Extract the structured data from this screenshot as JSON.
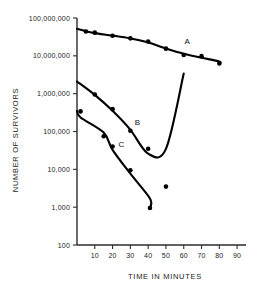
{
  "chart_data": {
    "type": "line",
    "title": "",
    "xlabel": "TIME IN MINUTES",
    "ylabel": "NUMBER OF SURVIVORS",
    "yscale": "log",
    "xlim": [
      0,
      95
    ],
    "ylim": [
      100,
      100000000
    ],
    "grid": false,
    "legend": "inline-curve-labels",
    "x_ticks": [
      10,
      20,
      30,
      40,
      50,
      60,
      70,
      80,
      90
    ],
    "x_tick_labels": [
      "10",
      "20",
      "30",
      "40",
      "50",
      "60",
      "70",
      "80",
      "90"
    ],
    "y_ticks": [
      100,
      1000,
      10000,
      100000,
      1000000,
      10000000,
      100000000
    ],
    "y_tick_labels": [
      "100",
      "1,000",
      "10,000",
      "100,000",
      "1,000,000",
      "10,000,000",
      "100,000,000"
    ],
    "series": [
      {
        "name": "A",
        "label": "A",
        "label_x": 62,
        "label_y": 21000000,
        "fit_line": [
          {
            "x": 0,
            "y": 52000000
          },
          {
            "x": 80,
            "y": 6300000
          }
        ],
        "points": [
          {
            "x": 5,
            "y": 44000000
          },
          {
            "x": 10,
            "y": 41000000
          },
          {
            "x": 20,
            "y": 34000000
          },
          {
            "x": 30,
            "y": 29000000
          },
          {
            "x": 40,
            "y": 24000000
          },
          {
            "x": 50,
            "y": 15500000
          },
          {
            "x": 60,
            "y": 10500000
          },
          {
            "x": 70,
            "y": 9800000
          },
          {
            "x": 80,
            "y": 6300000
          }
        ]
      },
      {
        "name": "B",
        "label": "B",
        "label_x": 34,
        "label_y": 150000,
        "fit_line": [
          {
            "x": 0,
            "y": 2100000
          },
          {
            "x": 60,
            "y": 3400000
          }
        ],
        "points": [
          {
            "x": 10,
            "y": 950000
          },
          {
            "x": 20,
            "y": 390000
          },
          {
            "x": 30,
            "y": 105000
          },
          {
            "x": 40,
            "y": 35000
          },
          {
            "x": 50,
            "y": 3500
          }
        ]
      },
      {
        "name": "C",
        "label": "C",
        "label_x": 25,
        "label_y": 38000,
        "fit_line": [
          {
            "x": 0,
            "y": 350000
          },
          {
            "x": 41,
            "y": 950
          }
        ],
        "points": [
          {
            "x": 2,
            "y": 340000
          },
          {
            "x": 15,
            "y": 75000
          },
          {
            "x": 20,
            "y": 40000
          },
          {
            "x": 30,
            "y": 9500
          },
          {
            "x": 41,
            "y": 950
          }
        ]
      }
    ]
  }
}
